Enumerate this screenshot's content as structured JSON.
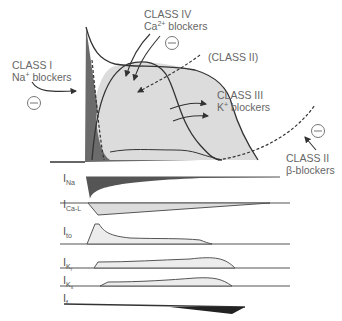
{
  "diagram": {
    "labels": {
      "class1": {
        "line1": "CLASS I",
        "line2_pre": "Na",
        "line2_sup": "+",
        "line2_post": " blockers"
      },
      "class4": {
        "line1": "CLASS IV",
        "line2_pre": "Ca",
        "line2_sup": "2+",
        "line2_post": " blockers"
      },
      "class2_paren": "(CLASS II)",
      "class3": {
        "line1": "CLASS III",
        "line2_pre": "K",
        "line2_sup": "+",
        "line2_post": " blockers"
      },
      "class2": {
        "line1": "CLASS II",
        "line2": "β-blockers"
      },
      "inhibit_symbol": "⊖"
    },
    "currents": [
      {
        "main": "I",
        "sub": "Na",
        "subsub": ""
      },
      {
        "main": "I",
        "sub": "Ca-L",
        "subsub": ""
      },
      {
        "main": "I",
        "sub": "to",
        "subsub": ""
      },
      {
        "main": "I",
        "sub": "K",
        "subsub": "r"
      },
      {
        "main": "I",
        "sub": "K",
        "subsub": "s"
      },
      {
        "main": "I",
        "sub": "f",
        "subsub": ""
      }
    ],
    "colors": {
      "dark_fill": "#6b6b6b",
      "light_fill": "#dcdcdc",
      "lighter_fill": "#ececec",
      "line": "#333333",
      "text": "#666666"
    }
  }
}
